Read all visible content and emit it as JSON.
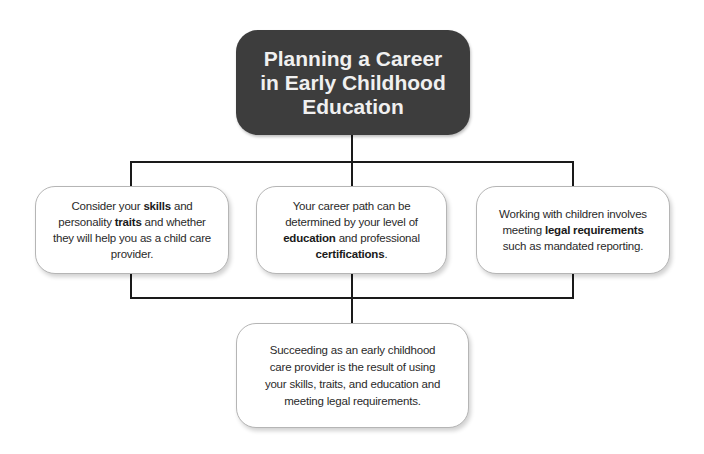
{
  "title": {
    "lines": [
      "Planning a Career",
      "in Early Childhood",
      "Education"
    ],
    "text": "Planning a Career in Early Childhood Education"
  },
  "colors": {
    "title_bg": "#3d3d3d",
    "title_text": "#f0f0f0",
    "node_bg": "#ffffff",
    "node_border": "#b5b5b5",
    "connector": "#1a1a1a"
  },
  "nodes": [
    {
      "id": "skills-traits",
      "parts": [
        {
          "text": "Consider your ",
          "bold": false
        },
        {
          "text": "skills",
          "bold": true
        },
        {
          "text": " and personality ",
          "bold": false
        },
        {
          "text": "traits",
          "bold": true
        },
        {
          "text": " and whether they will help you as a child care provider.",
          "bold": false
        }
      ]
    },
    {
      "id": "education-certifications",
      "parts": [
        {
          "text": "Your career path can be determined by your level of ",
          "bold": false
        },
        {
          "text": "education",
          "bold": true
        },
        {
          "text": " and professional ",
          "bold": false
        },
        {
          "text": "certifications",
          "bold": true
        },
        {
          "text": ".",
          "bold": false
        }
      ]
    },
    {
      "id": "legal-requirements",
      "parts": [
        {
          "text": "Working with children involves meeting ",
          "bold": false
        },
        {
          "text": "legal requirements",
          "bold": true
        },
        {
          "text": " such as mandated reporting.",
          "bold": false
        }
      ]
    },
    {
      "id": "conclusion",
      "parts": [
        {
          "text": "Succeeding as an early childhood care provider is the result of using your skills, traits, and education and meeting legal requirements.",
          "bold": false
        }
      ]
    }
  ]
}
